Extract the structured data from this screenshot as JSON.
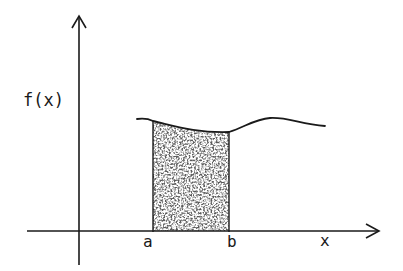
{
  "diagram": {
    "type": "definite-integral-area",
    "labels": {
      "y_axis": "f(x)",
      "x_axis": "x",
      "lower_bound": "a",
      "upper_bound": "b"
    },
    "colors": {
      "ink": "#1a1a1a",
      "background": "#ffffff",
      "shading": "#2a2a2a"
    }
  }
}
